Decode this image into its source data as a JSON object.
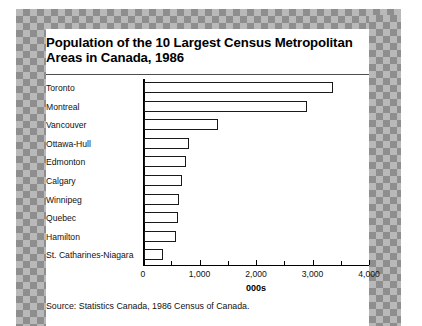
{
  "figure": {
    "title_line1": "Population of the 10 Largest Census Metropolitan",
    "title_line2": "Areas in Canada, 1986",
    "source": "Source: Statistics Canada, 1986 Census of Canada."
  },
  "chart_data": {
    "type": "bar",
    "orientation": "horizontal",
    "title": "Population of the 10 Largest Census Metropolitan Areas in Canada, 1986",
    "categories": [
      "Toronto",
      "Montreal",
      "Vancouver",
      "Ottawa-Hull",
      "Edmonton",
      "Calgary",
      "Winnipeg",
      "Quebec",
      "Hamilton",
      "St. Catharines-Niagara"
    ],
    "values": [
      3340,
      2880,
      1315,
      800,
      740,
      670,
      620,
      600,
      560,
      340
    ],
    "xlabel": "000s",
    "ylabel": "",
    "xlim": [
      0,
      4000
    ],
    "xticks": [
      0,
      1000,
      2000,
      3000,
      4000
    ],
    "xtick_labels": [
      "0",
      "1,000",
      "2,000",
      "3,000",
      "4,000"
    ],
    "minor_xticks": [
      500,
      1500,
      2500,
      3500
    ],
    "grid": false,
    "legend": false,
    "bar_fill": "#ffffff",
    "bar_edge": "#1a1a1a"
  },
  "style": {
    "frame_dark": "#8e8e8e",
    "frame_light": "#b9b9b9",
    "page_bg": "#ffffff",
    "text": "#111111"
  }
}
